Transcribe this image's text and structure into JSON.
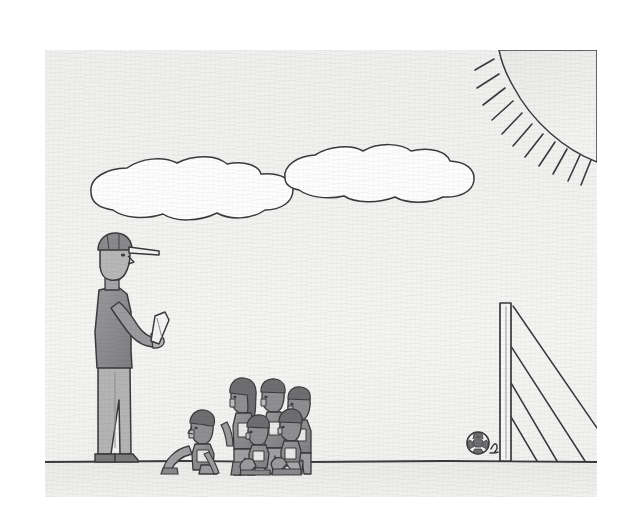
{
  "artwork": {
    "title": "Soccer coach with kneeling children and goal",
    "medium": "pencil sketch on paper",
    "caption_text": "",
    "paper": {
      "background_color": "#f7f7f6",
      "canvas_color": "#ffffff",
      "x": 45,
      "y": 50,
      "width": 552,
      "height": 447
    },
    "ink_color": "#3a3a3c",
    "shade_color": "#8e8e90",
    "sky": {
      "label": "sky",
      "color": "#f2f2f1",
      "horizon_y": 412
    },
    "ground": {
      "label": "ground",
      "color": "#ececeb",
      "line_color": "#3a3a3c"
    },
    "sun": {
      "label": "sun",
      "position": "top-right corner",
      "ray_count": 11,
      "color": "#efefee"
    },
    "clouds": [
      {
        "label": "left cloud",
        "cx": 175,
        "cy": 147,
        "rx": 88,
        "ry": 25
      },
      {
        "label": "right cloud",
        "cx": 356,
        "cy": 125,
        "rx": 74,
        "ry": 24
      }
    ],
    "coach": {
      "label": "coach",
      "description": "adult standing in profile facing right wearing a cap and holding a clipboard",
      "wears_cap": true,
      "holds_clipboard": true,
      "x": 95,
      "y": 278,
      "height": 186
    },
    "children": {
      "label": "group of children",
      "count": 6,
      "facing": "left toward the coach",
      "poses": [
        "kneeling",
        "kneeling",
        "standing",
        "kneeling",
        "standing",
        "standing"
      ],
      "x": 168,
      "y": 362,
      "width": 130,
      "height": 100
    },
    "goal": {
      "label": "goal post with net",
      "post_x": 505,
      "post_top_y": 303,
      "post_bottom_y": 458,
      "net_line_count": 4
    },
    "ball": {
      "label": "soccer ball",
      "cx": 478,
      "cy": 443,
      "r": 11,
      "panel_count": 5
    }
  }
}
